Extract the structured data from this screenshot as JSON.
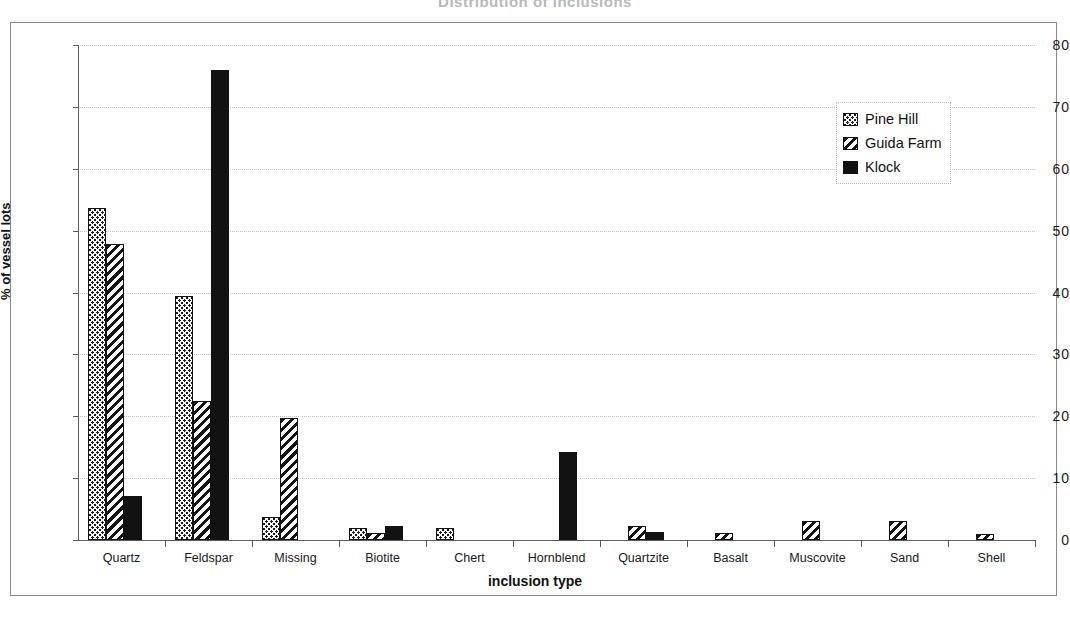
{
  "chart_data": {
    "type": "bar",
    "title": "Distribution of Inclusions",
    "xlabel": "inclusion type",
    "ylabel": "% of vessel lots",
    "ylim": [
      0,
      80
    ],
    "yticks": [
      0,
      10,
      20,
      30,
      40,
      50,
      60,
      70,
      80
    ],
    "grid": true,
    "legend_position": "top-right",
    "categories": [
      "Quartz",
      "Feldspar",
      "Missing",
      "Biotite",
      "Chert",
      "Hornblend",
      "Quartzite",
      "Basalt",
      "Muscovite",
      "Sand",
      "Shell"
    ],
    "series": [
      {
        "name": "Pine Hill",
        "pattern": "dotted",
        "values": [
          53.7,
          39.5,
          3.7,
          2.0,
          2.0,
          0,
          0,
          0,
          0,
          0,
          0
        ]
      },
      {
        "name": "Guida Farm",
        "pattern": "diagonal-hatch",
        "values": [
          47.8,
          22.5,
          19.8,
          1.1,
          0,
          0,
          2.2,
          1.2,
          3.0,
          3.0,
          1.0
        ]
      },
      {
        "name": "Klock",
        "pattern": "solid-black",
        "values": [
          7.1,
          76.0,
          0,
          2.3,
          0,
          14.2,
          1.3,
          0,
          0,
          0,
          0
        ]
      }
    ]
  },
  "colors": {
    "series_pine_hill": "#1b1b1b",
    "series_guida_farm": "#141414",
    "series_klock": "#121212",
    "axis": "#5c5c5c",
    "grid": "#c2c2c2",
    "frame": "#8a8a8a",
    "text": "#111111",
    "background": "#ffffff"
  }
}
